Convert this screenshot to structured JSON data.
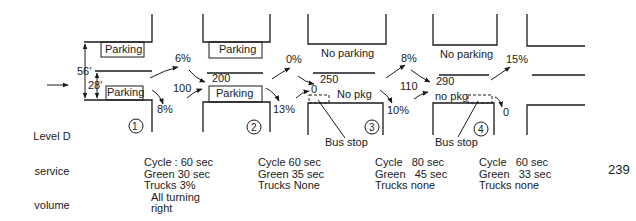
{
  "left_label": {
    "lines": [
      "Level D",
      "service",
      "volume",
      "for",
      "intersection 1"
    ]
  },
  "dimensions": {
    "total_width": "56′",
    "half_width": "28′"
  },
  "curb_labels": {
    "north_1": "Parking",
    "south_1": "Parking",
    "north_2": "Parking",
    "south_2": "Parking",
    "north_3": "No parking",
    "south_3": "No pkg",
    "north_4": "No parking",
    "south_4": "no pkg"
  },
  "turn_percentages": {
    "left_1": "6%",
    "right_1": "8%",
    "left_2": "0%",
    "right_2": "13%",
    "left_3": "8%",
    "right_3": "10%",
    "left_4": "15%",
    "right_4": "0"
  },
  "volumes": {
    "entering_2": "100",
    "through_2": "200",
    "through_3": "250",
    "entering_3": "0",
    "entering_4": "110",
    "through_4": "290"
  },
  "bus_stops": {
    "stop_3": "Bus stop",
    "stop_4": "Bus stop"
  },
  "intersections": [
    {
      "number": "1",
      "cycle": "Cycle : 60 sec",
      "green": "Green 30 sec",
      "trucks": "Trucks 3%",
      "note_1": "All turning",
      "note_2": "right"
    },
    {
      "number": "2",
      "cycle": "Cycle 60 sec",
      "green": "Green 35 sec",
      "trucks": "Trucks None"
    },
    {
      "number": "3",
      "cycle": "Cycle   80 sec",
      "green": "Green   45 sec",
      "trucks": "Trucks none"
    },
    {
      "number": "4",
      "cycle": "Cycle   60 sec",
      "green": "Green   33 sec",
      "trucks": "Trucks none"
    }
  ],
  "page_number": "239"
}
